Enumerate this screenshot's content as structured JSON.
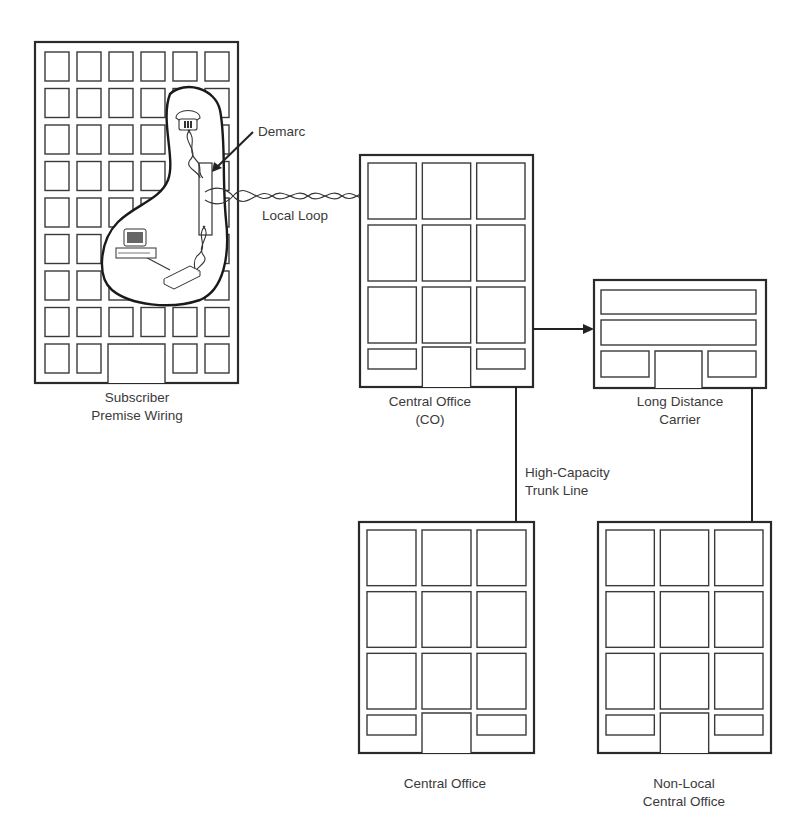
{
  "diagram": {
    "type": "telephone-network-topology",
    "buildings": {
      "subscriber": {
        "label_line1": "Subscriber",
        "label_line2": "Premise Wiring"
      },
      "central_office": {
        "label_line1": "Central Office",
        "label_line2": "(CO)"
      },
      "long_distance": {
        "label_line1": "Long Distance",
        "label_line2": "Carrier"
      },
      "central_office_2": {
        "label_line1": "Central Office"
      },
      "non_local_co": {
        "label_line1": "Non-Local",
        "label_line2": "Central Office"
      }
    },
    "annotations": {
      "demarc": "Demarc",
      "local_loop": "Local Loop",
      "trunk_line1": "High-Capacity",
      "trunk_line2": "Trunk Line"
    },
    "icons": [
      "telephone-icon",
      "computer-icon",
      "modem-icon"
    ],
    "colors": {
      "stroke": "#2a2a2a",
      "background": "#ffffff",
      "text": "#3a3a3a"
    }
  }
}
